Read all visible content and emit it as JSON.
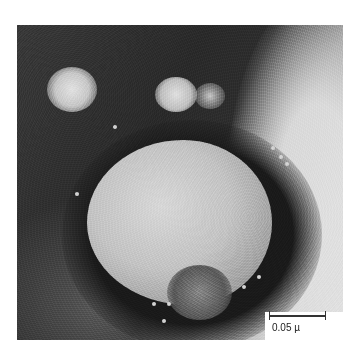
{
  "figure": {
    "type": "electron-micrograph",
    "scale_bar": {
      "label": "0.05 µ"
    }
  }
}
